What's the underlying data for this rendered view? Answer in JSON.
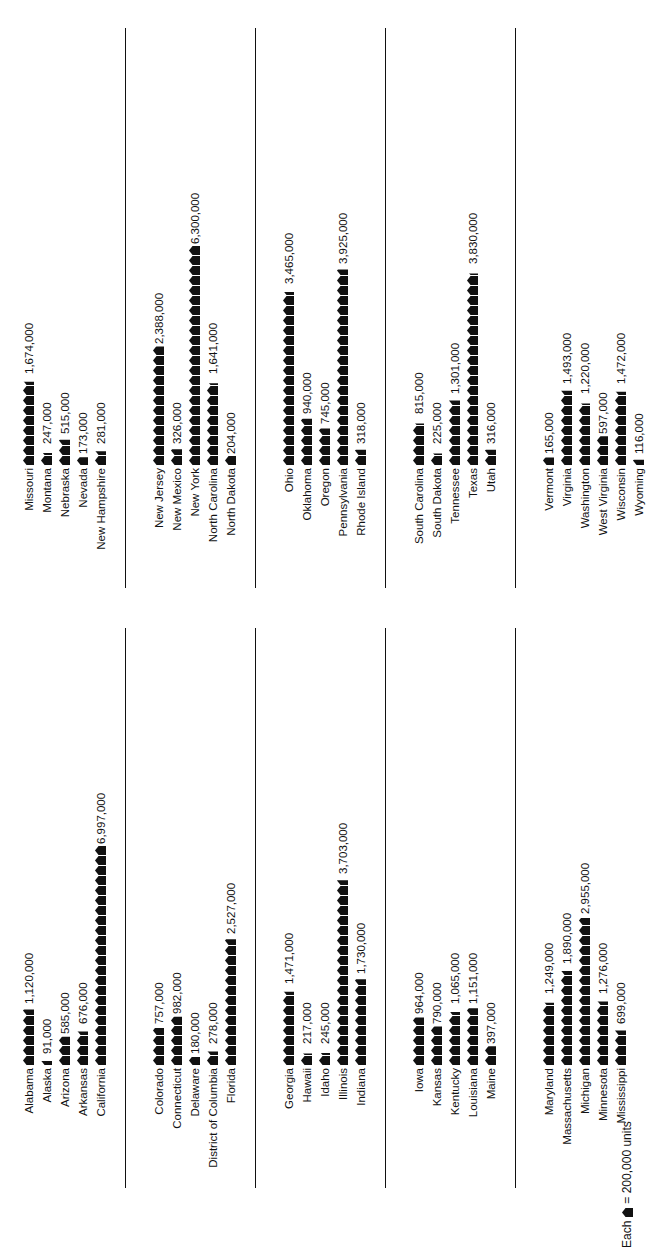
{
  "chart_data": {
    "type": "pictograph",
    "title": "",
    "unit_per_icon": 200000,
    "legend": {
      "prefix": "Each",
      "suffix": "= 200,000 units"
    },
    "orientation": "rotated -90 degrees",
    "groups": [
      {
        "states": [
          {
            "name": "Alabama",
            "value": 1120000,
            "label": "1,120,000"
          },
          {
            "name": "Alaska",
            "value": 91000,
            "label": "91,000"
          },
          {
            "name": "Arizona",
            "value": 585000,
            "label": "585,000"
          },
          {
            "name": "Arkansas",
            "value": 676000,
            "label": "676,000"
          },
          {
            "name": "California",
            "value": 6997000,
            "label": "6,997,000"
          }
        ]
      },
      {
        "states": [
          {
            "name": "Colorado",
            "value": 757000,
            "label": "757,000"
          },
          {
            "name": "Connecticut",
            "value": 982000,
            "label": "982,000"
          },
          {
            "name": "Delaware",
            "value": 180000,
            "label": "180,000"
          },
          {
            "name": "District of Columbia",
            "value": 278000,
            "label": "278,000"
          },
          {
            "name": "Florida",
            "value": 2527000,
            "label": "2,527,000"
          }
        ]
      },
      {
        "states": [
          {
            "name": "Georgia",
            "value": 1471000,
            "label": "1,471,000"
          },
          {
            "name": "Hawaii",
            "value": 217000,
            "label": "217,000"
          },
          {
            "name": "Idaho",
            "value": 245000,
            "label": "245,000"
          },
          {
            "name": "Illinois",
            "value": 3703000,
            "label": "3,703,000"
          },
          {
            "name": "Indiana",
            "value": 1730000,
            "label": "1,730,000"
          }
        ]
      },
      {
        "states": [
          {
            "name": "Iowa",
            "value": 964000,
            "label": "964,000"
          },
          {
            "name": "Kansas",
            "value": 790000,
            "label": "790,000"
          },
          {
            "name": "Kentucky",
            "value": 1065000,
            "label": "1,065,000"
          },
          {
            "name": "Louisiana",
            "value": 1151000,
            "label": "1,151,000"
          },
          {
            "name": "Maine",
            "value": 397000,
            "label": "397,000"
          }
        ]
      },
      {
        "states": [
          {
            "name": "Maryland",
            "value": 1249000,
            "label": "1,249,000"
          },
          {
            "name": "Massachusetts",
            "value": 1890000,
            "label": "1,890,000"
          },
          {
            "name": "Michigan",
            "value": 2955000,
            "label": "2,955,000"
          },
          {
            "name": "Minnesota",
            "value": 1276000,
            "label": "1,276,000"
          },
          {
            "name": "Mississippi",
            "value": 699000,
            "label": "699,000"
          }
        ]
      },
      {
        "states": [
          {
            "name": "Missouri",
            "value": 1674000,
            "label": "1,674,000"
          },
          {
            "name": "Montana",
            "value": 247000,
            "label": "247,000"
          },
          {
            "name": "Nebraska",
            "value": 515000,
            "label": "515,000"
          },
          {
            "name": "Nevada",
            "value": 173000,
            "label": "173,000"
          },
          {
            "name": "New Hampshire",
            "value": 281000,
            "label": "281,000"
          }
        ]
      },
      {
        "states": [
          {
            "name": "New Jersey",
            "value": 2388000,
            "label": "2,388,000"
          },
          {
            "name": "New Mexico",
            "value": 326000,
            "label": "326,000"
          },
          {
            "name": "New York",
            "value": 6300000,
            "label": "6,300,000"
          },
          {
            "name": "North Carolina",
            "value": 1641000,
            "label": "1,641,000"
          },
          {
            "name": "North Dakota",
            "value": 204000,
            "label": "204,000"
          }
        ]
      },
      {
        "states": [
          {
            "name": "Ohio",
            "value": 3465000,
            "label": "3,465,000"
          },
          {
            "name": "Oklahoma",
            "value": 940000,
            "label": "940,000"
          },
          {
            "name": "Oregon",
            "value": 745000,
            "label": "745,000"
          },
          {
            "name": "Pennsylvania",
            "value": 3925000,
            "label": "3,925,000"
          },
          {
            "name": "Rhode Island",
            "value": 318000,
            "label": "318,000"
          }
        ]
      },
      {
        "states": [
          {
            "name": "South Carolina",
            "value": 815000,
            "label": "815,000"
          },
          {
            "name": "South Dakota",
            "value": 225000,
            "label": "225,000"
          },
          {
            "name": "Tennessee",
            "value": 1301000,
            "label": "1,301,000"
          },
          {
            "name": "Texas",
            "value": 3830000,
            "label": "3,830,000"
          },
          {
            "name": "Utah",
            "value": 316000,
            "label": "316,000"
          }
        ]
      },
      {
        "states": [
          {
            "name": "Vermont",
            "value": 165000,
            "label": "165,000"
          },
          {
            "name": "Virginia",
            "value": 1493000,
            "label": "1,493,000"
          },
          {
            "name": "Washington",
            "value": 1220000,
            "label": "1,220,000"
          },
          {
            "name": "West Virginia",
            "value": 597000,
            "label": "597,000"
          },
          {
            "name": "Wisconsin",
            "value": 1472000,
            "label": "1,472,000"
          },
          {
            "name": "Wyoming",
            "value": 116000,
            "label": "116,000"
          }
        ]
      }
    ]
  },
  "colors": {
    "ink": "#111111",
    "background": "#ffffff"
  }
}
